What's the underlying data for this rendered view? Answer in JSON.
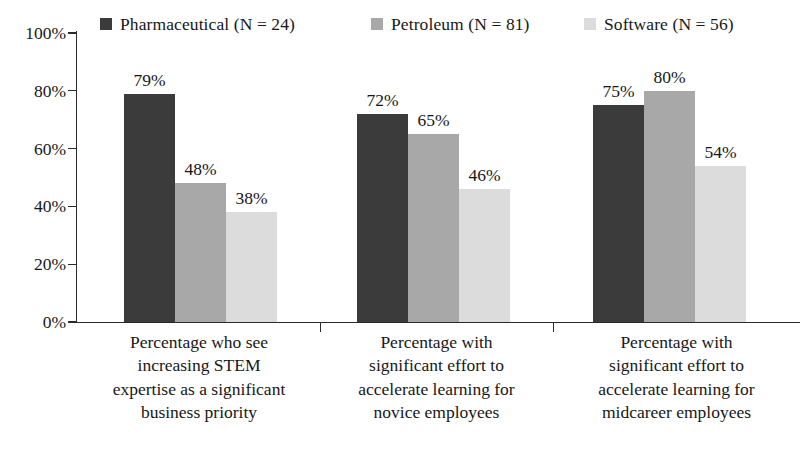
{
  "chart_data": {
    "type": "bar",
    "title": "",
    "subtitle": "",
    "xlabel": "",
    "ylabel": "",
    "ylim": [
      0,
      100
    ],
    "yticks": [
      "0%",
      "20%",
      "40%",
      "60%",
      "80%",
      "100%"
    ],
    "ytick_values": [
      0,
      20,
      40,
      60,
      80,
      100
    ],
    "grid": false,
    "legend_position": "top",
    "value_suffix": "%",
    "categories": [
      "Percentage who see increasing STEM expertise as a significant business priority",
      "Percentage with significant effort to accelerate learning for novice employees",
      "Percentage with significant effort to accelerate learning for midcareer employees"
    ],
    "category_lines": [
      [
        "Percentage who see",
        "increasing STEM",
        "expertise as a significant",
        "business priority"
      ],
      [
        "Percentage with",
        "significant effort to",
        "accelerate learning for",
        "novice employees"
      ],
      [
        "Percentage with",
        "significant effort to",
        "accelerate learning for",
        "midcareer employees"
      ]
    ],
    "series": [
      {
        "name": "Pharmaceutical (N = 24)",
        "short_name": "Pharmaceutical",
        "n": 24,
        "color": "#3b3b3b",
        "values": [
          79,
          72,
          75
        ],
        "labels": [
          "79%",
          "72%",
          "75%"
        ]
      },
      {
        "name": "Petroleum (N = 81)",
        "short_name": "Petroleum",
        "n": 81,
        "color": "#a8a8a8",
        "values": [
          48,
          65,
          80
        ],
        "labels": [
          "48%",
          "65%",
          "80%"
        ]
      },
      {
        "name": "Software (N = 56)",
        "short_name": "Software",
        "n": 56,
        "color": "#dcdcdc",
        "values": [
          38,
          46,
          54
        ],
        "labels": [
          "38%",
          "46%",
          "54%"
        ]
      }
    ],
    "grouped_values": [
      {
        "category_index": 0,
        "values": [
          79,
          72,
          75
        ],
        "labels": [
          "79%",
          "72%",
          "75%"
        ]
      },
      {
        "category_index": 1,
        "values": [
          48,
          65,
          80
        ],
        "labels": [
          "48%",
          "65%",
          "80%"
        ]
      },
      {
        "category_index": 2,
        "values": [
          38,
          46,
          54
        ],
        "labels": [
          "38%",
          "46%",
          "54%"
        ]
      }
    ],
    "axis_color": "#2b2b2b",
    "text_color": "#171717",
    "background": "#ffffff"
  }
}
